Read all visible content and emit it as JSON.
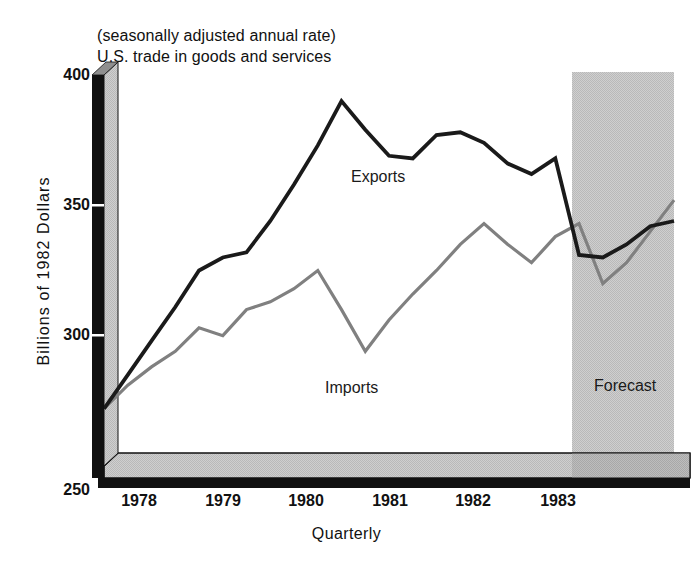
{
  "figure": {
    "width": 693,
    "height": 562,
    "background": "#ffffff"
  },
  "header": {
    "line1": "(seasonally adjusted annual rate)",
    "line2": "U.S. trade in goods and services"
  },
  "axes": {
    "y_title": "Billions of 1982 Dollars",
    "x_title": "Quarterly",
    "y_ticks": [
      "400",
      "350",
      "300",
      "250"
    ],
    "x_ticks": [
      "1978",
      "1979",
      "1980",
      "1981",
      "1982",
      "1983"
    ]
  },
  "annotations": {
    "exports": "Exports",
    "imports": "Imports",
    "forecast": "Forecast"
  },
  "colors": {
    "exports_line": "#1a1a1a",
    "imports_line": "#808080",
    "forecast_band": "#cccccc",
    "axis_dark": "#111111",
    "axis_light": "#b5b5b5",
    "plot_background": "#ffffff"
  },
  "chart_data": {
    "type": "line",
    "title": "U.S. trade in goods and services",
    "subtitle": "(seasonally adjusted annual rate)",
    "xlabel": "Quarterly",
    "ylabel": "Billions of 1982 Dollars",
    "ylim": [
      250,
      400
    ],
    "yticks": [
      250,
      300,
      350,
      400
    ],
    "xlim": [
      "1977Q4",
      "1983Q4"
    ],
    "xticks": [
      "1978",
      "1979",
      "1980",
      "1981",
      "1982",
      "1983"
    ],
    "grid": false,
    "legend": "inline-labels",
    "forecast_region": {
      "label": "Forecast",
      "start": "1982Q4",
      "end": "1983Q4"
    },
    "x": [
      "1977Q4",
      "1978Q1",
      "1978Q2",
      "1978Q3",
      "1978Q4",
      "1979Q1",
      "1979Q2",
      "1979Q3",
      "1979Q4",
      "1980Q1",
      "1980Q2",
      "1980Q3",
      "1980Q4",
      "1981Q1",
      "1981Q2",
      "1981Q3",
      "1981Q4",
      "1982Q1",
      "1982Q2",
      "1982Q3",
      "1982Q4",
      "1983Q1",
      "1983Q2",
      "1983Q3",
      "1983Q4"
    ],
    "series": [
      {
        "name": "Exports",
        "color": "#1a1a1a",
        "values": [
          272,
          285,
          298,
          311,
          325,
          330,
          332,
          344,
          358,
          373,
          390,
          379,
          369,
          368,
          377,
          378,
          374,
          366,
          362,
          368,
          331,
          330,
          335,
          342,
          344
        ]
      },
      {
        "name": "Imports",
        "color": "#808080",
        "values": [
          272,
          281,
          288,
          294,
          303,
          300,
          310,
          313,
          318,
          325,
          310,
          294,
          306,
          316,
          325,
          335,
          343,
          335,
          328,
          338,
          343,
          320,
          328,
          340,
          352
        ]
      }
    ]
  }
}
